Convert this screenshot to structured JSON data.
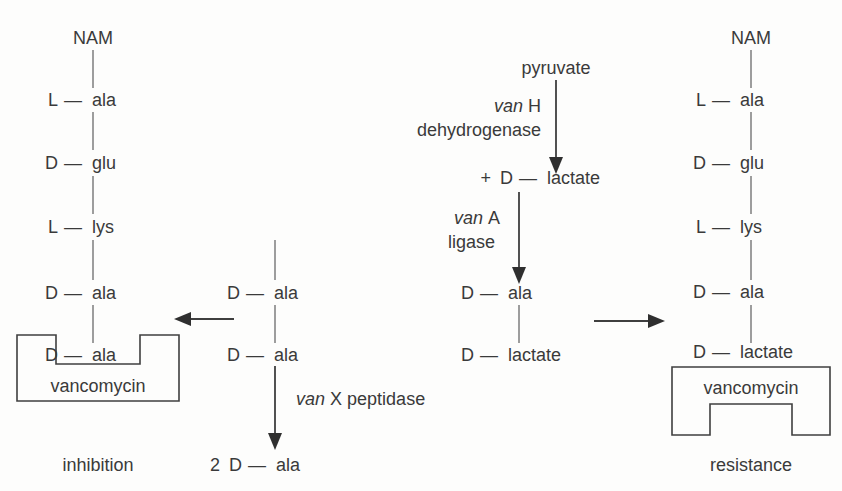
{
  "diagram": {
    "colors": {
      "ink": "#3a3a3a",
      "line": "#3f3f3f",
      "background": "#fdfdfc"
    }
  },
  "left_chain": {
    "caption": "inhibition",
    "head": "NAM",
    "residues": [
      {
        "stereo": "L",
        "dash": "—",
        "name": "ala"
      },
      {
        "stereo": "D",
        "dash": "—",
        "name": "glu"
      },
      {
        "stereo": "L",
        "dash": "—",
        "name": "lys"
      },
      {
        "stereo": "D",
        "dash": "—",
        "name": "ala"
      },
      {
        "stereo": "D",
        "dash": "—",
        "name": "ala"
      }
    ],
    "drug_box_label": "vancomycin"
  },
  "middle_chain": {
    "residues": [
      {
        "stereo": "D",
        "dash": "—",
        "name": "ala"
      },
      {
        "stereo": "D",
        "dash": "—",
        "name": "ala"
      }
    ],
    "enzyme": {
      "gene": "van",
      "letter": "X",
      "kind": "peptidase"
    },
    "product": {
      "count": "2",
      "stereo": "D",
      "dash": "—",
      "name": "ala"
    }
  },
  "right_pathway": {
    "substrate": "pyruvate",
    "enzyme_dehydrogenase": {
      "gene": "van",
      "letter": "H",
      "kind": "dehydrogenase"
    },
    "intermediate": {
      "prefix": "+",
      "stereo": "D",
      "dash": "—",
      "name": "lactate"
    },
    "enzyme_ligase": {
      "gene": "van",
      "letter": "A",
      "kind": "ligase"
    },
    "dipeptide": [
      {
        "stereo": "D",
        "dash": "—",
        "name": "ala"
      },
      {
        "stereo": "D",
        "dash": "—",
        "name": "lactate"
      }
    ]
  },
  "right_chain": {
    "caption": "resistance",
    "head": "NAM",
    "residues": [
      {
        "stereo": "L",
        "dash": "—",
        "name": "ala"
      },
      {
        "stereo": "D",
        "dash": "—",
        "name": "glu"
      },
      {
        "stereo": "L",
        "dash": "—",
        "name": "lys"
      },
      {
        "stereo": "D",
        "dash": "—",
        "name": "ala"
      },
      {
        "stereo": "D",
        "dash": "—",
        "name": "lactate"
      }
    ],
    "drug_box_label": "vancomycin"
  },
  "arrows": {
    "to_left_chain": "arrow-left",
    "to_right_chain": "arrow-right",
    "pyruvate_down": "arrow-down",
    "ligase_down": "arrow-down",
    "peptidase_down": "arrow-down"
  }
}
